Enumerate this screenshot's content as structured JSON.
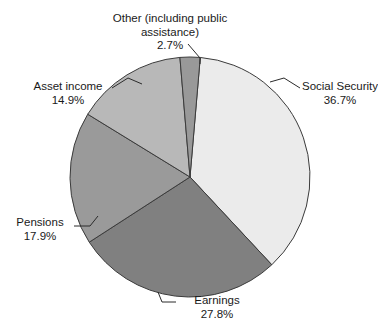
{
  "chart_data": {
    "type": "pie",
    "title": "",
    "subtitle": "",
    "xlabel": "",
    "ylabel": "",
    "legend_position": "none",
    "grid": false,
    "units": "percent",
    "start_angle_deg": 4.9,
    "direction": "clockwise",
    "categories": [
      "Social Security",
      "Earnings",
      "Pensions",
      "Asset income",
      "Other (including public assistance)"
    ],
    "values": [
      36.7,
      27.8,
      17.9,
      14.9,
      2.7
    ],
    "value_labels": [
      "36.7%",
      "27.8%",
      "17.9%",
      "14.9%",
      "2.7%"
    ],
    "colors": [
      "#ebebeb",
      "#808080",
      "#9a9a9a",
      "#b8b8b8",
      "#999999"
    ],
    "slices": [
      {
        "id": "social-security",
        "label": "Social Security",
        "value": 36.7,
        "value_label": "36.7%",
        "color": "#ebebeb"
      },
      {
        "id": "earnings",
        "label": "Earnings",
        "value": 27.8,
        "value_label": "27.8%",
        "color": "#808080"
      },
      {
        "id": "pensions",
        "label": "Pensions",
        "value": 17.9,
        "value_label": "17.9%",
        "color": "#9a9a9a"
      },
      {
        "id": "asset-income",
        "label": "Asset income",
        "value": 14.9,
        "value_label": "14.9%",
        "color": "#b8b8b8"
      },
      {
        "id": "other",
        "label": "Other (including public assistance)",
        "value": 2.7,
        "value_label": "2.7%",
        "color": "#999999"
      }
    ]
  },
  "labels": {
    "other": {
      "line1": "Other (including public",
      "line2": "assistance)",
      "value": "2.7%"
    },
    "social_security": {
      "name": "Social Security",
      "value": "36.7%"
    },
    "asset_income": {
      "name": "Asset income",
      "value": "14.9%"
    },
    "pensions": {
      "name": "Pensions",
      "value": "17.9%"
    },
    "earnings": {
      "name": "Earnings",
      "value": "27.8%"
    }
  },
  "style": {
    "background": "#ffffff",
    "outline": "#3b3b3b",
    "text": "#1a1a1a",
    "leader": "#2b2b2b"
  }
}
